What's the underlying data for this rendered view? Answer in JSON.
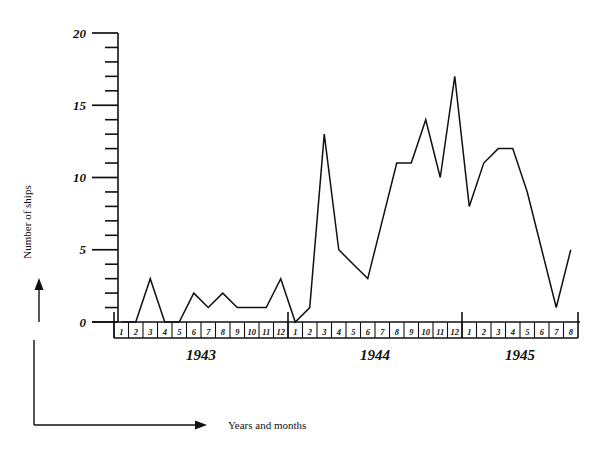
{
  "labels": {
    "y_axis_title": "Number of ships",
    "x_axis_title": "Years and months"
  },
  "chart_data": {
    "type": "line",
    "title": "",
    "xlabel": "Years and months",
    "ylabel": "Number of ships",
    "ylim": [
      0,
      20
    ],
    "yticks_major": [
      0,
      5,
      10,
      15,
      20
    ],
    "ytick_labels": [
      "0",
      "5",
      "10",
      "15",
      "20"
    ],
    "yticks_minor_step": 1,
    "grid": false,
    "legend": "none",
    "style": "hand-drawn",
    "groups": [
      {
        "year": "1943",
        "months": [
          "1",
          "2",
          "3",
          "4",
          "5",
          "6",
          "7",
          "8",
          "9",
          "10",
          "11",
          "12"
        ]
      },
      {
        "year": "1944",
        "months": [
          "1",
          "2",
          "3",
          "4",
          "5",
          "6",
          "7",
          "8",
          "9",
          "10",
          "11",
          "12"
        ]
      },
      {
        "year": "1945",
        "months": [
          "1",
          "2",
          "3",
          "4",
          "5",
          "6",
          "7",
          "8"
        ]
      }
    ],
    "categories": [
      "1943-1",
      "1943-2",
      "1943-3",
      "1943-4",
      "1943-5",
      "1943-6",
      "1943-7",
      "1943-8",
      "1943-9",
      "1943-10",
      "1943-11",
      "1943-12",
      "1944-1",
      "1944-2",
      "1944-3",
      "1944-4",
      "1944-5",
      "1944-6",
      "1944-7",
      "1944-8",
      "1944-9",
      "1944-10",
      "1944-11",
      "1944-12",
      "1945-1",
      "1945-2",
      "1945-3",
      "1945-4",
      "1945-5",
      "1945-6",
      "1945-7",
      "1945-8"
    ],
    "values": [
      0,
      0,
      3,
      0,
      0,
      2,
      1,
      2,
      1,
      1,
      1,
      3,
      0,
      1,
      13,
      5,
      4,
      3,
      7,
      11,
      11,
      14,
      10,
      17,
      8,
      11,
      12,
      12,
      9,
      5,
      1,
      5
    ],
    "annotations": []
  }
}
